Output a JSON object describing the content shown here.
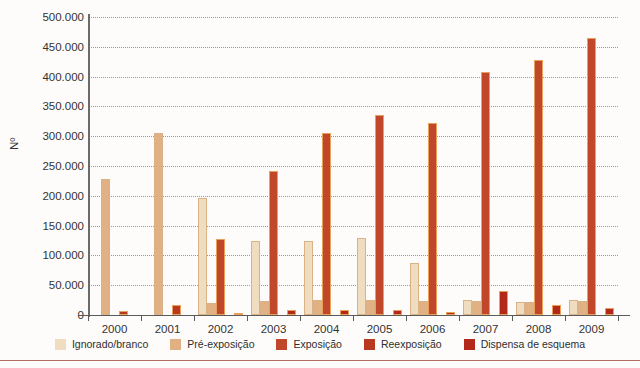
{
  "chart_data": {
    "type": "bar",
    "title": "",
    "xlabel": "",
    "ylabel": "Nº",
    "ylim": [
      0,
      500000
    ],
    "ytick_step": 50000,
    "grid": true,
    "legend_position": "bottom",
    "categories": [
      "2000",
      "2001",
      "2002",
      "2003",
      "2004",
      "2005",
      "2006",
      "2007",
      "2008",
      "2009"
    ],
    "ytick_labels": [
      "0",
      "50.000",
      "100.000",
      "150.000",
      "200.000",
      "250.000",
      "300.000",
      "350.000",
      "400.000",
      "450.000",
      "500.000"
    ],
    "series": [
      {
        "name": "Ignorado/branco",
        "color": "#f0dcbe",
        "values": [
          0,
          0,
          197000,
          125000,
          124000,
          130000,
          88000,
          25000,
          22000,
          25000
        ]
      },
      {
        "name": "Pré-exposição",
        "color": "#e2b183",
        "values": [
          228000,
          305000,
          20000,
          23000,
          26000,
          25000,
          24000,
          24000,
          21000,
          23000
        ]
      },
      {
        "name": "Exposição",
        "color": "#c0472a",
        "values": [
          0,
          0,
          128000,
          241000,
          305000,
          335000,
          323000,
          407000,
          428000,
          464000
        ]
      },
      {
        "name": "Reexposição",
        "color": "#b8391f",
        "values": [
          6000,
          16000,
          0,
          0,
          0,
          0,
          0,
          0,
          0,
          0
        ]
      },
      {
        "name": "Dispensa de esquema",
        "color": "#b2291a",
        "values": [
          0,
          0,
          3000,
          9000,
          9000,
          8000,
          5000,
          40000,
          16000,
          11000
        ]
      }
    ]
  }
}
